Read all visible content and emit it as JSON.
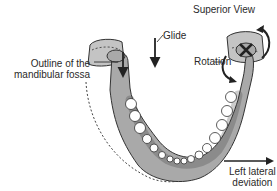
{
  "diagram": {
    "title": "Superior View",
    "labels": {
      "glide": "Glide",
      "rotation": "Rotation",
      "fossa_line1": "Outline of the",
      "fossa_line2": "mandibular fossa",
      "deviation_line1": "Left lateral",
      "deviation_line2": "deviation"
    },
    "colors": {
      "bone": "#a9a9a9",
      "bone_light": "#d0d0d0",
      "fossa": "#c4c4c4",
      "outline": "#333333",
      "teeth": "#ffffff"
    }
  }
}
